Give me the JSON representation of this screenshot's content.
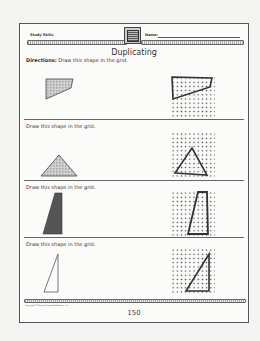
{
  "header": {
    "left_label": "Study Skills",
    "name_label": "Name:",
    "logo_icon": "book-logo-icon"
  },
  "title": "Duplicating",
  "directions_prefix": "Directions:",
  "sections": [
    {
      "instruction": "Draw this shape in the grid.",
      "shape": "quadrilateral",
      "fill": "dotted-gray"
    },
    {
      "instruction": "Draw this shape in the grid.",
      "shape": "triangle",
      "fill": "dotted-gray"
    },
    {
      "instruction": "Draw this shape in the grid.",
      "shape": "trapezoid",
      "fill": "dark-gray"
    },
    {
      "instruction": "Draw this shape in the grid.",
      "shape": "right-triangle",
      "fill": "none"
    }
  ],
  "footer": {
    "copyright": "Copyright © Teacher Created Materials, Inc.",
    "page_number": "150"
  }
}
